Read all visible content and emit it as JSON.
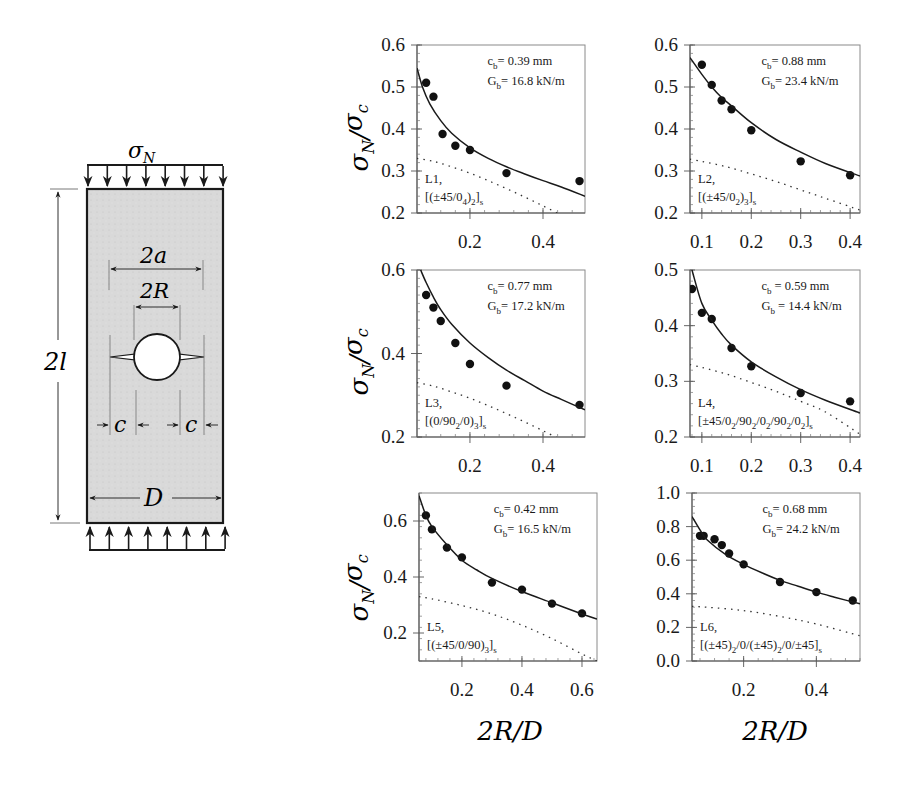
{
  "figure": {
    "specimen_diagram": {
      "load_label": "σ_N",
      "load_symbol": "σ",
      "load_sub": "N",
      "dimension_labels": {
        "length": "2l",
        "crack_span": "2a",
        "hole_diameter": "2R",
        "crack_length_left": "c",
        "crack_length_right": "c",
        "width": "D"
      }
    },
    "y_axis_label": {
      "main": "σ",
      "sub1": "N",
      "slash": "/",
      "main2": "σ",
      "sub2": "c"
    },
    "x_axis_label": "2R/D"
  },
  "chart_data": [
    {
      "type": "scatter",
      "id": "L1",
      "title": "",
      "xlabel": "2R/D",
      "ylabel": "σN/σc",
      "xlim": [
        0.055,
        0.515
      ],
      "ylim": [
        0.2,
        0.6
      ],
      "xticks": [
        0.2,
        0.4
      ],
      "yticks": [
        0.2,
        0.3,
        0.4,
        0.5,
        0.6
      ],
      "annotation": {
        "cb": "c_b= 0.39 mm",
        "Gb": "G_b= 16.8 kN/m"
      },
      "label": "L1,",
      "layup": "[(±45/0_4)_2]_s",
      "series": [
        {
          "name": "Experiment",
          "style": "markers",
          "x": [
            0.08,
            0.1,
            0.125,
            0.16,
            0.2,
            0.3,
            0.5
          ],
          "y": [
            0.51,
            0.477,
            0.388,
            0.36,
            0.35,
            0.295,
            0.276
          ]
        },
        {
          "name": "Cohesive model (solid)",
          "style": "solid",
          "x": [
            0.055,
            0.07,
            0.09,
            0.12,
            0.15,
            0.2,
            0.25,
            0.3,
            0.35,
            0.4,
            0.45,
            0.515
          ],
          "y": [
            0.545,
            0.5,
            0.46,
            0.42,
            0.39,
            0.355,
            0.33,
            0.31,
            0.293,
            0.277,
            0.262,
            0.24
          ]
        },
        {
          "name": "Reference (dotted)",
          "style": "dotted",
          "x": [
            0.055,
            0.1,
            0.15,
            0.2,
            0.25,
            0.3,
            0.35,
            0.4,
            0.45
          ],
          "y": [
            0.33,
            0.323,
            0.31,
            0.295,
            0.277,
            0.258,
            0.238,
            0.217,
            0.195
          ]
        }
      ]
    },
    {
      "type": "scatter",
      "id": "L2",
      "title": "",
      "xlabel": "2R/D",
      "ylabel": "σN/σc",
      "xlim": [
        0.076,
        0.42
      ],
      "ylim": [
        0.2,
        0.6
      ],
      "xticks": [
        0.1,
        0.2,
        0.3,
        0.4
      ],
      "yticks": [
        0.2,
        0.3,
        0.4,
        0.5,
        0.6
      ],
      "annotation": {
        "cb": "c_b= 0.88 mm",
        "Gb": "G_b=  23.4 kN/m"
      },
      "label": "L2,",
      "layup": "[(±45/0_2)_3]_s",
      "series": [
        {
          "name": "Experiment",
          "style": "markers",
          "x": [
            0.1,
            0.12,
            0.14,
            0.16,
            0.2,
            0.3,
            0.4
          ],
          "y": [
            0.553,
            0.505,
            0.468,
            0.447,
            0.397,
            0.323,
            0.29
          ]
        },
        {
          "name": "Cohesive model (solid)",
          "style": "solid",
          "x": [
            0.076,
            0.1,
            0.12,
            0.14,
            0.16,
            0.2,
            0.25,
            0.3,
            0.35,
            0.42
          ],
          "y": [
            0.57,
            0.53,
            0.5,
            0.475,
            0.455,
            0.415,
            0.375,
            0.345,
            0.318,
            0.288
          ]
        },
        {
          "name": "Reference (dotted)",
          "style": "dotted",
          "x": [
            0.076,
            0.1,
            0.15,
            0.2,
            0.25,
            0.3,
            0.35,
            0.42
          ],
          "y": [
            0.328,
            0.323,
            0.31,
            0.293,
            0.275,
            0.255,
            0.235,
            0.207
          ]
        }
      ]
    },
    {
      "type": "scatter",
      "id": "L3",
      "title": "",
      "xlabel": "2R/D",
      "ylabel": "σN/σc",
      "xlim": [
        0.055,
        0.515
      ],
      "ylim": [
        0.2,
        0.6
      ],
      "xticks": [
        0.2,
        0.4
      ],
      "yticks": [
        0.2,
        0.4,
        0.6
      ],
      "annotation": {
        "cb": "c_b= 0.77 mm",
        "Gb": "G_b= 17.2 kN/m"
      },
      "label": "L3,",
      "layup": "[(0/90_2/0)_3]_s",
      "series": [
        {
          "name": "Experiment",
          "style": "markers",
          "x": [
            0.08,
            0.1,
            0.12,
            0.16,
            0.2,
            0.3,
            0.5
          ],
          "y": [
            0.54,
            0.51,
            0.478,
            0.425,
            0.375,
            0.323,
            0.277
          ]
        },
        {
          "name": "Cohesive model (solid)",
          "style": "solid",
          "x": [
            0.065,
            0.08,
            0.1,
            0.12,
            0.15,
            0.2,
            0.25,
            0.3,
            0.35,
            0.4,
            0.45,
            0.515
          ],
          "y": [
            0.6,
            0.57,
            0.535,
            0.505,
            0.47,
            0.425,
            0.39,
            0.36,
            0.335,
            0.31,
            0.29,
            0.265
          ]
        },
        {
          "name": "Reference (dotted)",
          "style": "dotted",
          "x": [
            0.055,
            0.1,
            0.15,
            0.2,
            0.25,
            0.3,
            0.35,
            0.4,
            0.45
          ],
          "y": [
            0.33,
            0.322,
            0.308,
            0.293,
            0.275,
            0.256,
            0.236,
            0.215,
            0.193
          ]
        }
      ]
    },
    {
      "type": "scatter",
      "id": "L4",
      "title": "",
      "xlabel": "2R/D",
      "ylabel": "σN/σc",
      "xlim": [
        0.076,
        0.42
      ],
      "ylim": [
        0.2,
        0.5
      ],
      "xticks": [
        0.1,
        0.2,
        0.3,
        0.4
      ],
      "yticks": [
        0.2,
        0.3,
        0.4,
        0.5
      ],
      "annotation": {
        "cb": "c_b = 0.59 mm",
        "Gb": "G_b = 14.4 kN/m"
      },
      "label": "L4,",
      "layup": "[±45/0_2/90_2/0_2/90_2/0_2]_s",
      "series": [
        {
          "name": "Experiment",
          "style": "markers",
          "x": [
            0.08,
            0.1,
            0.12,
            0.16,
            0.2,
            0.3,
            0.4
          ],
          "y": [
            0.466,
            0.423,
            0.412,
            0.36,
            0.327,
            0.279,
            0.264
          ]
        },
        {
          "name": "Cohesive model (solid)",
          "style": "solid",
          "x": [
            0.08,
            0.1,
            0.12,
            0.14,
            0.16,
            0.2,
            0.25,
            0.3,
            0.35,
            0.42
          ],
          "y": [
            0.5,
            0.44,
            0.41,
            0.385,
            0.365,
            0.335,
            0.308,
            0.285,
            0.266,
            0.243
          ]
        },
        {
          "name": "Reference (dotted)",
          "style": "dotted",
          "x": [
            0.076,
            0.1,
            0.15,
            0.2,
            0.25,
            0.3,
            0.35,
            0.42
          ],
          "y": [
            0.33,
            0.325,
            0.313,
            0.298,
            0.282,
            0.264,
            0.245,
            0.205
          ]
        }
      ]
    },
    {
      "type": "scatter",
      "id": "L5",
      "title": "",
      "xlabel": "2R/D",
      "ylabel": "σN/σc",
      "xlim": [
        0.057,
        0.65
      ],
      "ylim": [
        0.1,
        0.7
      ],
      "xticks": [
        0.2,
        0.4,
        0.6
      ],
      "yticks": [
        0.2,
        0.4,
        0.6
      ],
      "annotation": {
        "cb": "c_b= 0.42 mm",
        "Gb": "G_b= 16.5 kN/m"
      },
      "label": "L5,",
      "layup": "[(±45/0/90)_3]_s",
      "series": [
        {
          "name": "Experiment",
          "style": "markers",
          "x": [
            0.08,
            0.1,
            0.15,
            0.2,
            0.3,
            0.4,
            0.5,
            0.6
          ],
          "y": [
            0.62,
            0.57,
            0.505,
            0.47,
            0.38,
            0.355,
            0.305,
            0.27
          ]
        },
        {
          "name": "Cohesive model (solid)",
          "style": "solid",
          "x": [
            0.057,
            0.08,
            0.1,
            0.15,
            0.2,
            0.25,
            0.3,
            0.4,
            0.5,
            0.6,
            0.65
          ],
          "y": [
            0.69,
            0.62,
            0.58,
            0.515,
            0.46,
            0.425,
            0.395,
            0.348,
            0.308,
            0.268,
            0.25
          ]
        },
        {
          "name": "Reference (dotted)",
          "style": "dotted",
          "x": [
            0.057,
            0.1,
            0.2,
            0.3,
            0.4,
            0.5,
            0.6,
            0.65
          ],
          "y": [
            0.33,
            0.322,
            0.298,
            0.268,
            0.228,
            0.18,
            0.125,
            0.1
          ]
        }
      ]
    },
    {
      "type": "scatter",
      "id": "L6",
      "title": "",
      "xlabel": "2R/D",
      "ylabel": "σN/σc",
      "xlim": [
        0.058,
        0.52
      ],
      "ylim": [
        0.0,
        1.0
      ],
      "xticks": [
        0.2,
        0.4
      ],
      "yticks": [
        0.0,
        0.2,
        0.4,
        0.6,
        0.8,
        1.0
      ],
      "annotation": {
        "cb": "c_b= 0.68 mm",
        "Gb": "G_b= 24.2 kN/m"
      },
      "label": "L6,",
      "layup": "[(±45)_2/0/(±45)_2/0/±45]_s",
      "series": [
        {
          "name": "Experiment",
          "style": "markers",
          "x": [
            0.08,
            0.09,
            0.12,
            0.14,
            0.16,
            0.2,
            0.3,
            0.4,
            0.5
          ],
          "y": [
            0.745,
            0.745,
            0.725,
            0.69,
            0.64,
            0.575,
            0.47,
            0.41,
            0.36
          ]
        },
        {
          "name": "Cohesive model (solid)",
          "style": "solid",
          "x": [
            0.058,
            0.08,
            0.1,
            0.15,
            0.2,
            0.25,
            0.3,
            0.35,
            0.4,
            0.45,
            0.52
          ],
          "y": [
            0.86,
            0.78,
            0.72,
            0.635,
            0.575,
            0.525,
            0.48,
            0.445,
            0.41,
            0.38,
            0.34
          ]
        },
        {
          "name": "Reference (dotted)",
          "style": "dotted",
          "x": [
            0.058,
            0.1,
            0.2,
            0.3,
            0.4,
            0.52
          ],
          "y": [
            0.325,
            0.32,
            0.3,
            0.265,
            0.22,
            0.15
          ]
        }
      ]
    }
  ],
  "layout": {
    "panels": [
      {
        "id": "L1",
        "box": [
          417,
          45,
          585,
          213
        ]
      },
      {
        "id": "L2",
        "box": [
          690,
          45,
          860,
          213
        ]
      },
      {
        "id": "L3",
        "box": [
          417,
          270,
          585,
          437
        ]
      },
      {
        "id": "L4",
        "box": [
          690,
          270,
          860,
          437
        ]
      },
      {
        "id": "L5",
        "box": [
          419,
          493,
          597,
          661
        ]
      },
      {
        "id": "L6",
        "box": [
          692,
          493,
          860,
          661
        ]
      }
    ]
  }
}
